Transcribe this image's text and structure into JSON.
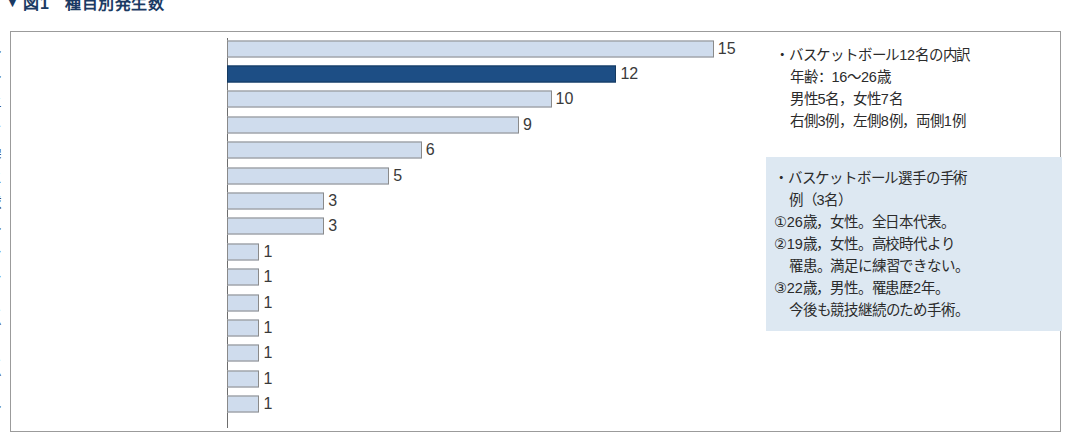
{
  "caption": {
    "marker": "▼",
    "label": "図1",
    "title": "種目別発生数"
  },
  "chart_data": {
    "type": "bar",
    "orientation": "horizontal",
    "title": "種目別発生数",
    "xlabel": "",
    "ylabel": "",
    "xlim": [
      0,
      15
    ],
    "grid": false,
    "legend": "none",
    "highlight_category": "バスケットボール",
    "highlight_color": "#1d4e85",
    "bar_color": "#cfdced",
    "categories": [
      "バレーボール",
      "バスケットボール",
      "陸上",
      "サッカー",
      "器械体操",
      "クラッシックバレエ",
      "野球",
      "ハンドボール",
      "マラソン",
      "バドミントン",
      "硬式テニス",
      "チアリーディング",
      "ソフトテニス",
      "ジョギング",
      "アメリカンフットボール"
    ],
    "values": [
      15,
      12,
      10,
      9,
      6,
      5,
      3,
      3,
      1,
      1,
      1,
      1,
      1,
      1,
      1
    ]
  },
  "notes": {
    "breakdown": {
      "lines": [
        {
          "text": "・バスケットボール12名の内訳",
          "indent": false
        },
        {
          "text": "年齢：16〜26歳",
          "indent": true
        },
        {
          "text": "男性5名，女性7名",
          "indent": true
        },
        {
          "text": "右側3例，左側8例，両側1例",
          "indent": true
        }
      ]
    },
    "cases": {
      "lines": [
        {
          "text": "・バスケットボール選手の手術",
          "indent": false
        },
        {
          "text": "例（3名）",
          "indent": true
        },
        {
          "text": "①26歳，女性。全日本代表。",
          "indent": false
        },
        {
          "text": "②19歳，女性。高校時代より",
          "indent": false
        },
        {
          "text": "罹患。満足に練習できない。",
          "indent": true
        },
        {
          "text": "③22歳，男性。罹患歴2年。",
          "indent": false
        },
        {
          "text": "今後も競技継続のため手術。",
          "indent": true
        }
      ]
    }
  }
}
